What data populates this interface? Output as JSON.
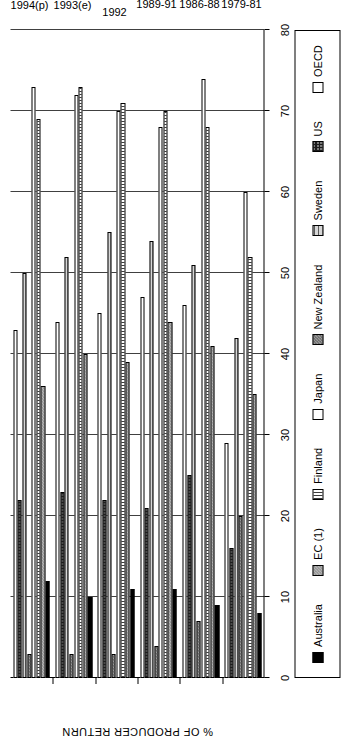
{
  "chart_data": {
    "type": "bar",
    "orientation": "horizontal-grouped",
    "title": "",
    "xlabel": "",
    "ylabel": "% OF PRODUCER RETURN",
    "ylim": [
      0,
      80
    ],
    "ytick_labels": [
      "0",
      "10",
      "20",
      "30",
      "40",
      "50",
      "60",
      "70",
      "80"
    ],
    "ytick_values": [
      0,
      10,
      20,
      30,
      40,
      50,
      60,
      70,
      80
    ],
    "grid": true,
    "legend_position": "bottom",
    "categories": [
      "1979-81",
      "1986-88",
      "1989-91",
      "1992",
      "1993(e)",
      "1994(p)"
    ],
    "series": [
      {
        "name": "Australia",
        "fill": "f-australia",
        "values": [
          8,
          9,
          11,
          11,
          10,
          12
        ]
      },
      {
        "name": "EC (1)",
        "fill": "f-ec",
        "values": [
          35,
          41,
          44,
          39,
          40,
          36
        ]
      },
      {
        "name": "Finland",
        "fill": "f-finland",
        "values": [
          52,
          68,
          70,
          71,
          73,
          69
        ]
      },
      {
        "name": "Japan",
        "fill": "f-japan",
        "values": [
          60,
          74,
          68,
          70,
          72,
          73
        ]
      },
      {
        "name": "New Zealand",
        "fill": "f-newzealand",
        "values": [
          20,
          7,
          4,
          3,
          3,
          3
        ]
      },
      {
        "name": "Sweden",
        "fill": "f-sweden",
        "values": [
          42,
          51,
          54,
          55,
          52,
          50
        ]
      },
      {
        "name": "US",
        "fill": "f-us",
        "values": [
          16,
          25,
          21,
          22,
          23,
          22
        ]
      },
      {
        "name": "OECD",
        "fill": "f-oecd",
        "values": [
          29,
          46,
          47,
          45,
          44,
          43
        ]
      }
    ]
  },
  "legend": {
    "items": [
      {
        "label": "Australia",
        "swatch": "f-australia"
      },
      {
        "label": "EC (1)",
        "swatch": "f-ec"
      },
      {
        "label": "Finland",
        "swatch": "f-finland"
      },
      {
        "label": "Japan",
        "swatch": "f-japan"
      },
      {
        "label": "New Zealand",
        "swatch": "f-newzealand"
      },
      {
        "label": "Sweden",
        "swatch": "f-sweden"
      },
      {
        "label": "US",
        "swatch": "f-us"
      },
      {
        "label": "OECD",
        "swatch": "f-oecd"
      }
    ]
  }
}
